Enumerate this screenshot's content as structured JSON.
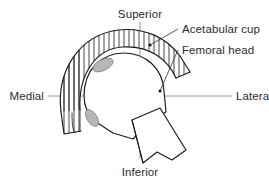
{
  "figure": {
    "background_color": "#ffffff",
    "line_color": "#1a1a1a",
    "axis_color": "#8a8a8a",
    "text_color": "#2b2b2b",
    "shading_color": "#b7b7b7",
    "width": 269,
    "height": 183
  },
  "axes": {
    "vertical": {
      "top_label": "Superior",
      "bottom_label": "Inferior"
    },
    "horizontal": {
      "left_label": "Medial",
      "right_label": "Lateral"
    }
  },
  "annotations": [
    {
      "label": "Acetabular cup",
      "target": "hatched-arc-band",
      "leader": "line-from-text-to-cup"
    },
    {
      "label": "Femoral head",
      "target": "rounded-head-body",
      "leader": "line-from-text-to-head"
    }
  ],
  "structures": {
    "acetabular_cup": "hatched arc band",
    "femoral_head": "rounded polygonal body",
    "femoral_neck": "tapered stem toward inferior-lateral",
    "contact_shading": "two gray ellipses on medial rim"
  }
}
